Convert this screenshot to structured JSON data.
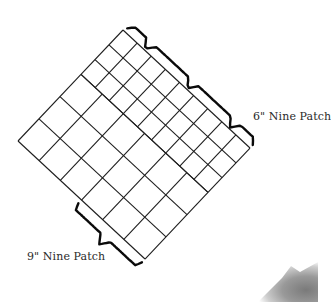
{
  "diagram": {
    "labels": {
      "six_inch": "6\" Nine Patch",
      "nine_inch": "9\" Nine Patch"
    },
    "layout": {
      "units": "inches",
      "width_u": 18,
      "height_v": 15,
      "regions": [
        {
          "name": "6-inch nine patch strip",
          "block_size": 6,
          "cell_size": 2,
          "u_range": [
            0,
            18
          ],
          "v_range": [
            0,
            6
          ],
          "block_count": 3
        },
        {
          "name": "9-inch nine patch strip",
          "block_size": 9,
          "cell_size": 3,
          "u_range": [
            0,
            18
          ],
          "v_range": [
            6,
            15
          ],
          "block_count": 2
        }
      ]
    },
    "colors": {
      "line": "#1e1e1e",
      "brace": "#0a0a0a",
      "text": "#2a2a2a",
      "background": "#ffffff"
    }
  }
}
